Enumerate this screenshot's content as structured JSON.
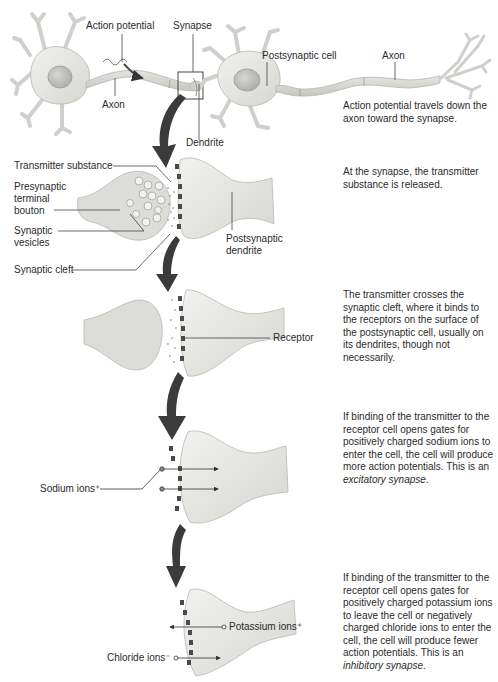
{
  "figure": {
    "colors": {
      "cell_fill": "#e6e6e3",
      "cell_stroke": "#b8b8b4",
      "axon_fill": "#d4d4d0",
      "nucleus_fill": "#c4c4c0",
      "arrow_fill": "#3a3a3a",
      "receptor_fill": "#4a4a4a",
      "leader_line": "#444444",
      "text": "#2b2b2b"
    }
  },
  "panel1": {
    "labels": {
      "action_potential": "Action potential",
      "synapse": "Synapse",
      "axon_left": "Axon",
      "dendrite": "Dendrite",
      "postsynaptic_cell": "Postsynaptic cell",
      "axon_right": "Axon"
    },
    "description": "Action potential travels down the axon toward the synapse."
  },
  "panel2": {
    "labels": {
      "transmitter_substance": "Transmitter substance",
      "presynaptic_line1": "Presynaptic",
      "presynaptic_line2": "terminal",
      "presynaptic_line3": "bouton",
      "vesicles_line1": "Synaptic",
      "vesicles_line2": "vesicles",
      "synaptic_cleft": "Synaptic cleft",
      "postsynaptic_line1": "Postsynaptic",
      "postsynaptic_line2": "dendrite"
    },
    "description": "At the synapse, the transmitter substance is released."
  },
  "panel3": {
    "labels": {
      "receptor": "Receptor"
    },
    "description": "The transmitter crosses the synaptic cleft, where it binds to the receptors on the surface of the postsynaptic cell, usually on its dendrites, though not necessarily."
  },
  "panel4": {
    "labels": {
      "sodium_ions": "Sodium ions⁺"
    },
    "description_main": "If binding of the transmitter to the receptor cell opens gates for positively charged sodium ions to enter the cell, the cell will produce more action potentials. This is an ",
    "description_term": "excitatory synapse",
    "description_end": "."
  },
  "panel5": {
    "labels": {
      "potassium_ions": "Potassium ions⁺",
      "chloride_ions": "Chloride ions⁻"
    },
    "description_main": "If binding of the transmitter to the receptor cell opens gates for positively charged potassium ions to leave the cell or negatively charged chloride ions to enter the cell, the cell will produce fewer action potentials. This is an ",
    "description_term": "inhibitory synapse",
    "description_end": "."
  }
}
